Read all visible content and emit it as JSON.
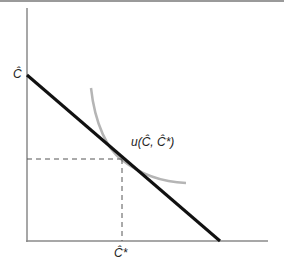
{
  "diagram": {
    "type": "indifference-curve-budget-line",
    "y_intercept_label": "Ĉ",
    "x_tangent_label": "Ĉ*",
    "curve_label": "u(Ĉ, Ĉ*)",
    "colors": {
      "axes": "#8a8a8a",
      "budget_line": "#111111",
      "indifference_curve": "#b5b5b5",
      "dashed_guides": "#555555"
    }
  }
}
